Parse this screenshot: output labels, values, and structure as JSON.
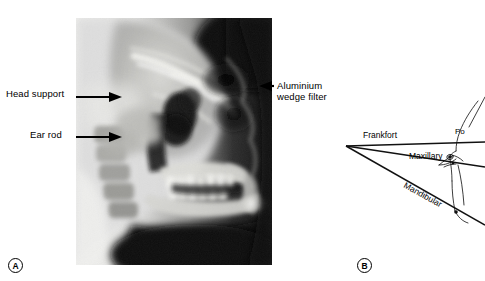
{
  "figure": {
    "panels": [
      {
        "id": "A",
        "letter": "A",
        "type": "lateral-cephalometric-radiograph",
        "annotations": [
          {
            "name": "head-support",
            "label": "Head support"
          },
          {
            "name": "ear-rod",
            "label": "Ear rod"
          },
          {
            "name": "aluminium-wedge-filter",
            "label_line1": "Aluminium",
            "label_line2": "wedge filter"
          }
        ]
      },
      {
        "id": "B",
        "letter": "B",
        "type": "cephalometric-tracing-diagram",
        "lines": [
          {
            "name": "frankfort-plane",
            "label": "Frankfort"
          },
          {
            "name": "maxillary-plane",
            "label": "Maxillary"
          },
          {
            "name": "mandibular-plane",
            "label": "Mandibular"
          }
        ],
        "landmarks": [
          {
            "name": "porion",
            "label": "Po"
          }
        ]
      }
    ]
  },
  "colors": {
    "ink": "#000000",
    "paper": "#ffffff",
    "film_dark": "#0c0c0c",
    "film_light": "#e8e8e6"
  }
}
